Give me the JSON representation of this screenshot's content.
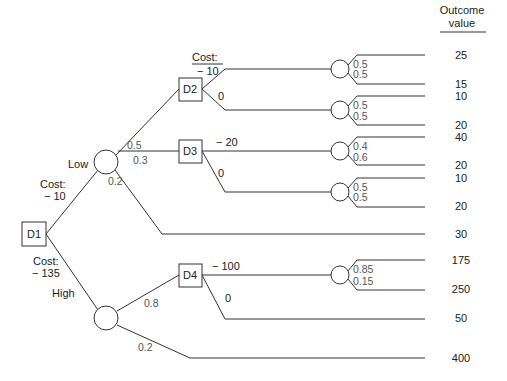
{
  "header": {
    "line1": "Outcome",
    "line2": "value"
  },
  "nodes": {
    "d1": "D1",
    "d2": "D2",
    "d3": "D3",
    "d4": "D4"
  },
  "d1_branches": {
    "low": {
      "label": "Low",
      "cost_label": "Cost:",
      "cost_value": "− 10"
    },
    "high": {
      "label": "High",
      "cost_label": "Cost:",
      "cost_value": "− 135"
    }
  },
  "low_chance": {
    "p_d2": "0.5",
    "p_d3": "0.3",
    "p_end": "0.2"
  },
  "high_chance": {
    "p_d4": "0.8",
    "p_end": "0.2"
  },
  "d2_branches": {
    "cost_label": "Cost:",
    "act": "− 10",
    "no_act": "0"
  },
  "d3_branches": {
    "act": "− 20",
    "no_act": "0"
  },
  "d4_branches": {
    "act": "− 100",
    "no_act": "0"
  },
  "chance_probs": {
    "c1": {
      "up": "0.5",
      "down": "0.5"
    },
    "c2": {
      "up": "0.5",
      "down": "0.5"
    },
    "c3": {
      "up": "0.4",
      "down": "0.6"
    },
    "c4": {
      "up": "0.5",
      "down": "0.5"
    },
    "c5": {
      "up": "0.85",
      "down": "0.15"
    }
  },
  "outcomes": [
    "25",
    "15",
    "10",
    "20",
    "40",
    "20",
    "10",
    "20",
    "30",
    "175",
    "250",
    "50",
    "400"
  ]
}
